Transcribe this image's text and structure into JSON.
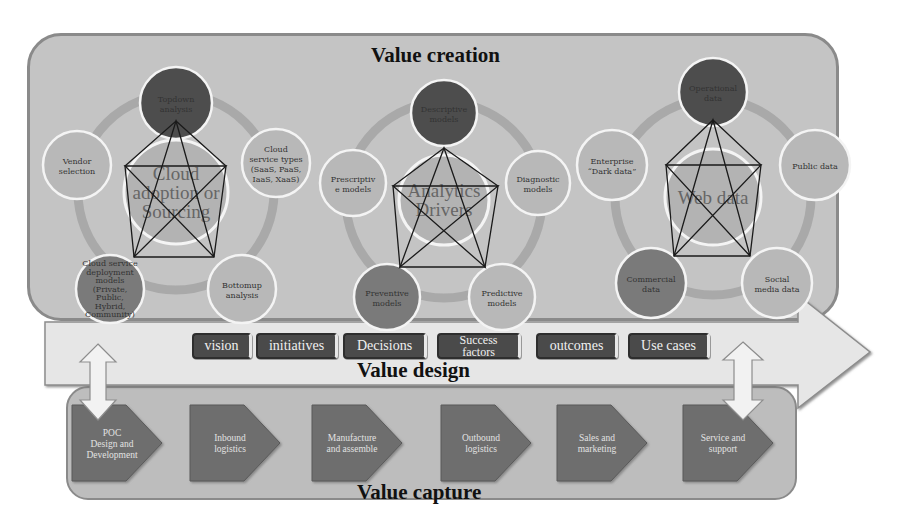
{
  "sections": {
    "creation_title": "Value creation",
    "design_title": "Value design",
    "capture_title": "Value capture"
  },
  "clusters": [
    {
      "center": [
        "Cloud",
        "adoption or",
        "Sourcing"
      ],
      "nodes": [
        {
          "lines": [
            "Topdown",
            "analysis"
          ],
          "shade": "dark"
        },
        {
          "lines": [
            "Cloud",
            "service types",
            "(SaaS, PaaS,",
            "IaaS, XaaS)"
          ],
          "shade": "light"
        },
        {
          "lines": [
            "Bottomup",
            "analysis"
          ],
          "shade": "light"
        },
        {
          "lines": [
            "Cloud service",
            "deployment",
            "models",
            "(Private,",
            "Public,",
            "Hybrid,",
            "Community)"
          ],
          "shade": "medium"
        },
        {
          "lines": [
            "Vendor",
            "selection"
          ],
          "shade": "light"
        }
      ]
    },
    {
      "center": [
        "Analytics",
        "Drivers"
      ],
      "nodes": [
        {
          "lines": [
            "Descriptive",
            "models"
          ],
          "shade": "dark"
        },
        {
          "lines": [
            "Diagnostic",
            "models"
          ],
          "shade": "light"
        },
        {
          "lines": [
            "Predictive",
            "models"
          ],
          "shade": "light"
        },
        {
          "lines": [
            "Preventive",
            "models"
          ],
          "shade": "medium"
        },
        {
          "lines": [
            "Prescriptiv",
            "e models"
          ],
          "shade": "light"
        }
      ]
    },
    {
      "center": [
        "Web data"
      ],
      "nodes": [
        {
          "lines": [
            "Operational",
            "data"
          ],
          "shade": "dark"
        },
        {
          "lines": [
            "Public data"
          ],
          "shade": "light"
        },
        {
          "lines": [
            "Social",
            "media data"
          ],
          "shade": "light"
        },
        {
          "lines": [
            "Commercial",
            "data"
          ],
          "shade": "medium"
        },
        {
          "lines": [
            "Enterprise",
            "“Dark data”"
          ],
          "shade": "light"
        }
      ]
    }
  ],
  "design_chips": [
    {
      "label": "vision"
    },
    {
      "label": "initiatives"
    },
    {
      "label": "Decisions"
    },
    {
      "label": "Success factors"
    },
    {
      "label": "outcomes"
    },
    {
      "label": "Use cases"
    }
  ],
  "capture_steps": [
    {
      "lines": [
        "POC",
        "Design and",
        "Development"
      ]
    },
    {
      "lines": [
        "Inbound",
        "logistics"
      ]
    },
    {
      "lines": [
        "Manufacture",
        "and assemble"
      ]
    },
    {
      "lines": [
        "Outbound",
        "logistics"
      ]
    },
    {
      "lines": [
        "Sales and",
        "marketing"
      ]
    },
    {
      "lines": [
        "Service and",
        "support"
      ]
    }
  ],
  "colors": {
    "panel": "#c4c4c4",
    "node_dark": "#4d4d4d",
    "node_medium": "#7a7a7a",
    "node_light": "#b8b8b8",
    "chip": "#4a4a4a",
    "step": "#6e6e6e",
    "arrow": "#e6e6e6"
  }
}
